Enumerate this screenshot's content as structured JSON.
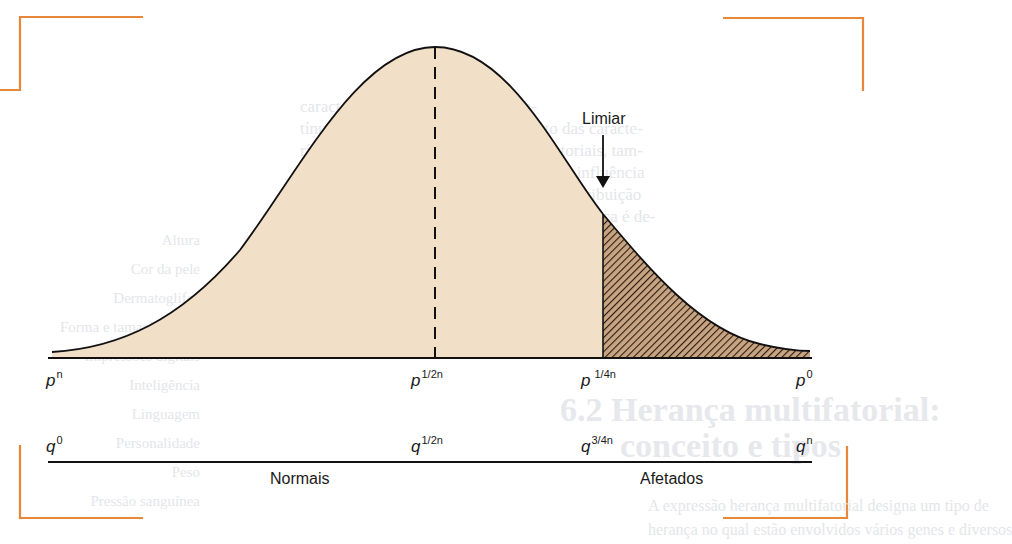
{
  "diagram": {
    "threshold_label": "Limiar",
    "group_labels": {
      "normal": "Normais",
      "affected": "Afetados"
    },
    "p_axis": [
      {
        "base": "p",
        "exp": "n"
      },
      {
        "base": "p",
        "exp": "1/2n"
      },
      {
        "base": "p",
        "exp": "1/4n"
      },
      {
        "base": "p",
        "exp": "0"
      }
    ],
    "q_axis": [
      {
        "base": "q",
        "exp": "0"
      },
      {
        "base": "q",
        "exp": "1/2n"
      },
      {
        "base": "q",
        "exp": "3/4n"
      },
      {
        "base": "q",
        "exp": "n"
      }
    ],
    "colors": {
      "curve_fill": "#f1dfc8",
      "hatch_fill": "#c8a582",
      "hatch_line": "#2a1a10",
      "frame_accent": "#e8873a",
      "line": "#111111"
    }
  },
  "bleed_text": {
    "right_paragraph": [
      "caracteres contínuos ou quase con-",
      "tínuos que representam aspectos tanto das caracte-",
      "rísticas poligênicas quanto das multifatoriais, tam-",
      "bém denominadas por vários genes com influência",
      "ambientais variáveis, mas apresentam distribuição",
      "descontínua na população. Seu tipo de herança é de-",
      "terminado multifatorial."
    ],
    "left_list": [
      "Altura",
      "Cor da pele",
      "Dermatoglifos",
      "Forma e tamanho do corpo",
      "Impressões digitais",
      "Inteligência",
      "Linguagem",
      "Personalidade",
      "Peso",
      "Pressão sanguínea",
      "Tempo de resposta"
    ],
    "heading": "6.2 Herança multifatorial:",
    "heading_line2": "conceito e tipos",
    "body_bottom": [
      "A expressão herança multifatorial designa um tipo de",
      "herança no qual estão envolvidos vários genes e diversos"
    ]
  }
}
